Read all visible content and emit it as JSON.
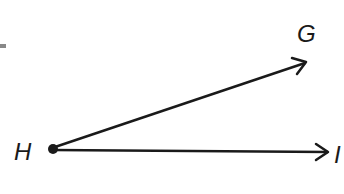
{
  "diagram": {
    "type": "angle",
    "vertex": {
      "label": "H",
      "x": 52,
      "y": 148
    },
    "rays": [
      {
        "label": "G",
        "end": {
          "x": 306,
          "y": 62
        },
        "label_pos": {
          "x": 300,
          "y": 42
        }
      },
      {
        "label": "I",
        "end": {
          "x": 330,
          "y": 152
        },
        "label_pos": {
          "x": 337,
          "y": 163
        }
      }
    ],
    "stroke_color": "#1a1a1a",
    "background": "#ffffff"
  },
  "labels": {
    "vertex": "H",
    "ray1": "G",
    "ray2": "I"
  }
}
